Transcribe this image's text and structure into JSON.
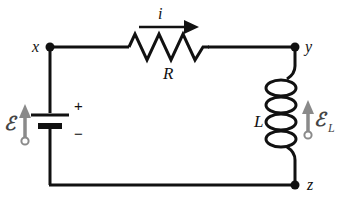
{
  "diagram": {
    "background_color": "#ffffff",
    "wire_color": "#111111",
    "accent_color": "#8a8a8a",
    "nodes": [
      {
        "id": "x",
        "label": "x",
        "x": 50,
        "y": 47
      },
      {
        "id": "y",
        "label": "y",
        "x": 295,
        "y": 47
      },
      {
        "id": "z",
        "label": "z",
        "x": 295,
        "y": 185
      }
    ],
    "components": {
      "resistor": {
        "label": "R",
        "symbol": "zigzag"
      },
      "inductor": {
        "label": "L",
        "symbol": "coil"
      },
      "battery": {
        "plus_sign": "+",
        "minus_sign": "−",
        "emf_label": "ℰ",
        "symbol": "cell"
      },
      "inductor_emf": {
        "emf_label": "ℰ",
        "emf_subscript": "L"
      }
    },
    "current": {
      "label": "i",
      "direction": "right",
      "arrow": "arrow-right-icon"
    }
  }
}
